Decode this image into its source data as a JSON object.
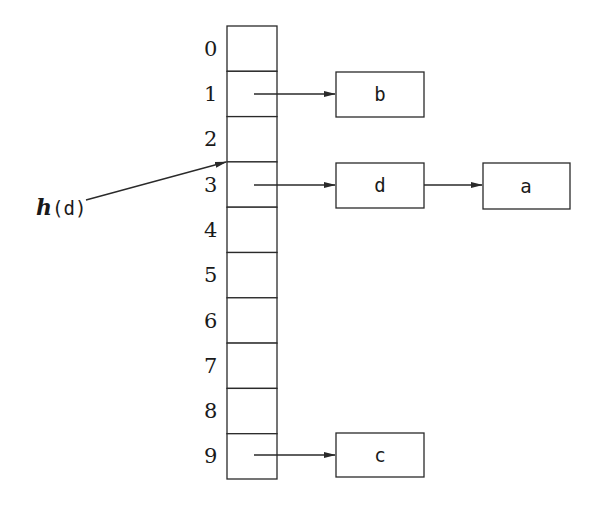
{
  "diagram": {
    "table": {
      "indices": [
        "0",
        "1",
        "2",
        "3",
        "4",
        "5",
        "6",
        "7",
        "8",
        "9"
      ],
      "x": 227,
      "y": 26,
      "width": 50,
      "row_height": 45.3
    },
    "nodes": [
      {
        "id": "b",
        "label": "b",
        "slot": 1,
        "x": 336,
        "y": 72,
        "w": 88,
        "h": 45
      },
      {
        "id": "d",
        "label": "d",
        "slot": 3,
        "x": 336,
        "y": 163,
        "w": 88,
        "h": 45
      },
      {
        "id": "a",
        "label": "a",
        "slot": 3,
        "x": 483,
        "y": 163,
        "w": 87,
        "h": 45
      },
      {
        "id": "c",
        "label": "c",
        "slot": 9,
        "x": 336,
        "y": 433,
        "w": 88,
        "h": 44
      }
    ],
    "chains": [
      {
        "slot": 1,
        "sequence": [
          "b"
        ]
      },
      {
        "slot": 3,
        "sequence": [
          "d",
          "a"
        ]
      },
      {
        "slot": 9,
        "sequence": [
          "c"
        ]
      }
    ],
    "hash_pointer": {
      "label_func": "h",
      "label_arg": "(d)",
      "target_slot": 3
    }
  }
}
